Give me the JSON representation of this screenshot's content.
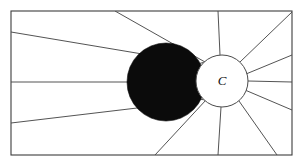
{
  "figure": {
    "background_color": "#ffffff",
    "width": 305,
    "height": 162
  },
  "frame": {
    "name": "outer-border",
    "x": 11,
    "y": 11,
    "width": 281,
    "height": 144,
    "stroke_color": "#3c3c3c",
    "fill_color": "#ffffff"
  },
  "source_circle": {
    "label": "C",
    "cx": 222,
    "cy": 81,
    "r": 26,
    "fill_color": "#ffffff",
    "stroke_color": "#4a4a4a"
  },
  "occulting_circle": {
    "label": "",
    "cx": 166,
    "cy": 82,
    "r": 39,
    "fill_color": "#0b0b0b",
    "stroke_color": "#0b0b0b"
  },
  "rays": {
    "stroke_color": "#4a4a4a",
    "stroke_width": 0.95,
    "count": 14,
    "segments": [
      {
        "name": "ray-left-upper-tangent",
        "x1": 11,
        "y1": 32,
        "x2": 196,
        "y2": 63
      },
      {
        "name": "ray-left-middle",
        "x1": 11,
        "y1": 82,
        "x2": 196,
        "y2": 82
      },
      {
        "name": "ray-left-lower-tangent",
        "x1": 11,
        "y1": 123,
        "x2": 196,
        "y2": 101
      },
      {
        "name": "ray-top-left-diagonal",
        "x1": 115,
        "y1": 11,
        "x2": 205,
        "y2": 62
      },
      {
        "name": "ray-top-vertical",
        "x1": 218,
        "y1": 11,
        "x2": 220,
        "y2": 55
      },
      {
        "name": "ray-top-right-corner",
        "x1": 292,
        "y1": 12,
        "x2": 240,
        "y2": 62
      },
      {
        "name": "ray-right-upper",
        "x1": 292,
        "y1": 55,
        "x2": 246,
        "y2": 74
      },
      {
        "name": "ray-right-middle",
        "x1": 292,
        "y1": 82,
        "x2": 248,
        "y2": 81
      },
      {
        "name": "ray-right-lower",
        "x1": 292,
        "y1": 110,
        "x2": 245,
        "y2": 90
      },
      {
        "name": "ray-bottom-left-diag",
        "x1": 155,
        "y1": 155,
        "x2": 206,
        "y2": 100
      },
      {
        "name": "ray-bottom-vertical",
        "x1": 218,
        "y1": 155,
        "x2": 221,
        "y2": 107
      },
      {
        "name": "ray-bottom-right-diag",
        "x1": 277,
        "y1": 155,
        "x2": 239,
        "y2": 101
      },
      {
        "name": "ray-crescent-upper",
        "x1": 190,
        "y1": 66,
        "x2": 205,
        "y2": 62
      },
      {
        "name": "ray-crescent-lower",
        "x1": 190,
        "y1": 98,
        "x2": 206,
        "y2": 100
      }
    ]
  }
}
